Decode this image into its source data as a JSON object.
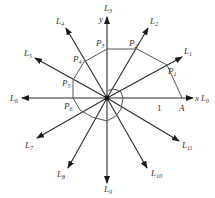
{
  "figure": {
    "axis_labels": {
      "x": "x",
      "y": "y"
    },
    "unit_label": "1",
    "start_point": "A",
    "rays": [
      {
        "name": "L",
        "sub": "0"
      },
      {
        "name": "L",
        "sub": "1"
      },
      {
        "name": "L",
        "sub": "2"
      },
      {
        "name": "L",
        "sub": "3"
      },
      {
        "name": "L",
        "sub": "4"
      },
      {
        "name": "L",
        "sub": "5"
      },
      {
        "name": "L",
        "sub": "6"
      },
      {
        "name": "L",
        "sub": "7"
      },
      {
        "name": "L",
        "sub": "8"
      },
      {
        "name": "L",
        "sub": "9"
      },
      {
        "name": "L",
        "sub": "10"
      },
      {
        "name": "L",
        "sub": "11"
      }
    ],
    "points": [
      {
        "name": "P",
        "sub": "1"
      },
      {
        "name": "P",
        "sub": "2"
      },
      {
        "name": "P",
        "sub": "3"
      },
      {
        "name": "P",
        "sub": "4"
      },
      {
        "name": "P",
        "sub": "5"
      },
      {
        "name": "P",
        "sub": "6"
      }
    ],
    "colors": {
      "line": "#2a2a2a",
      "spiral": "#555555",
      "text": "#333333"
    }
  }
}
